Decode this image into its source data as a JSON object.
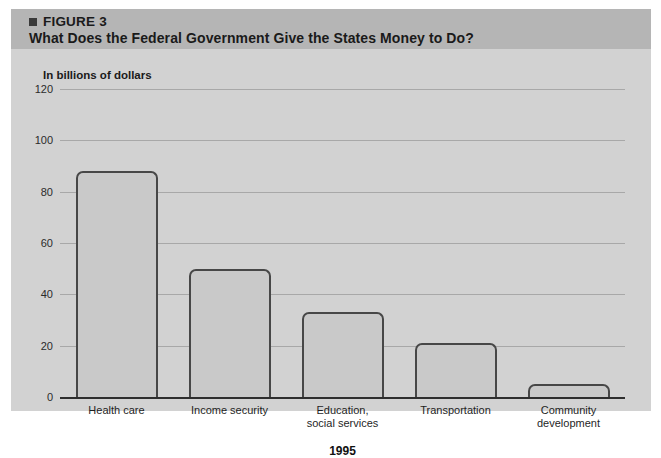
{
  "figure": {
    "bullet_icon": "square-bullet-icon",
    "number_label": "FIGURE 3",
    "title": "What Does the Federal Government Give the States Money to Do?",
    "header_bg": "#b5b5b5",
    "body_bg": "#d2d2d2"
  },
  "chart_data": {
    "type": "bar",
    "title": "What Does the Federal Government Give the States Money to Do?",
    "subtitle": "In billions of dollars",
    "categories": [
      "Health care",
      "Income security",
      "Education,\nsocial services",
      "Transportation",
      "Community\ndevelopment"
    ],
    "category_lines": [
      [
        "Health care"
      ],
      [
        "Income security"
      ],
      [
        "Education,",
        "social services"
      ],
      [
        "Transportation"
      ],
      [
        "Community",
        "development"
      ]
    ],
    "values": [
      88,
      50,
      33,
      21,
      5
    ],
    "xlabel": "1995",
    "ylabel": "In billions of dollars",
    "ylim": [
      0,
      120
    ],
    "yticks": [
      0,
      20,
      40,
      60,
      80,
      100,
      120
    ],
    "ytick_labels": [
      "0",
      "20",
      "40",
      "60",
      "80",
      "100",
      "120"
    ],
    "grid": true,
    "legend": null,
    "bar_fill": "#c9c9c9",
    "bar_stroke": "#474747",
    "gridline_color": "#a8a8a8",
    "axis_color": "#2e2e2e"
  }
}
